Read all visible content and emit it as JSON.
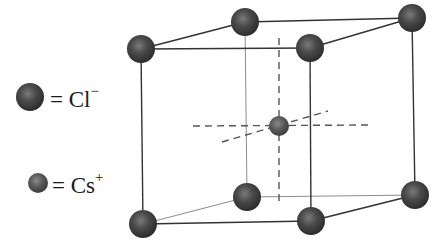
{
  "diagram": {
    "legend": [
      {
        "ion": "Cl",
        "charge": "−",
        "label_prefix": "= Cl",
        "sphere_size": "large"
      },
      {
        "ion": "Cs",
        "charge": "+",
        "label_prefix": "= Cs",
        "sphere_size": "small"
      }
    ],
    "colors": {
      "cl_sphere": "#3a3a3a",
      "cl_highlight": "#7a7a7a",
      "cs_sphere": "#4e4e4e",
      "cs_highlight": "#8a8a8a",
      "edge": "#333333",
      "back_edge": "#8c8c8c",
      "dashed_axis": "#555555"
    },
    "corner_atoms": [
      {
        "name": "front-top-left",
        "x": 141,
        "y": 49
      },
      {
        "name": "back-top-left",
        "x": 245,
        "y": 22
      },
      {
        "name": "front-top-right",
        "x": 310,
        "y": 48
      },
      {
        "name": "back-top-right",
        "x": 412,
        "y": 18
      },
      {
        "name": "front-bottom-left",
        "x": 143,
        "y": 224
      },
      {
        "name": "back-bottom-left",
        "x": 247,
        "y": 197
      },
      {
        "name": "front-bottom-right",
        "x": 311,
        "y": 221
      },
      {
        "name": "back-bottom-right",
        "x": 415,
        "y": 195
      }
    ],
    "center_atom": {
      "x": 279,
      "y": 126
    }
  }
}
